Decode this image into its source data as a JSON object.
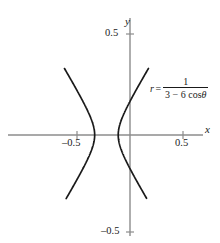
{
  "chart_data": {
    "type": "line",
    "title": "",
    "xlabel": "x",
    "ylabel": "y",
    "xlim": [
      -0.72,
      0.85
    ],
    "ylim": [
      -0.62,
      0.65
    ],
    "grid": false,
    "legend": null,
    "annotations": [
      {
        "name": "polar-equation",
        "text": "r = 1 / (3 - 6 cos θ)",
        "lhs": "r",
        "equals": "=",
        "numerator": "1",
        "denominator_prefix": "3 − 6 cos",
        "denominator_symbol": "θ",
        "x_px": 152,
        "y_px": 82
      }
    ],
    "x_ticks": [
      {
        "value": -0.5,
        "label": "–0.5"
      },
      {
        "value": 0.5,
        "label": "0.5"
      }
    ],
    "y_ticks": [
      {
        "value": 0.5,
        "label": "0.5"
      },
      {
        "value": -0.5,
        "label": "–0.5"
      }
    ],
    "curve_description": "Hyperbola r = 1/(3 - 6 cos(theta)), two branches opening left and right",
    "series": [
      {
        "name": "left-branch",
        "points_px": "M68,30 L74,45 L80,62 L85,80 L88,98 L90,116 L90.5,135 L90,154 L88,172 L85,190 L80,208 L74,225 L68,240"
      },
      {
        "name": "right-branch",
        "points_px": "M150,30 L140,48 L130,68 L121,88 L114,108 L110,122 L108.5,135 L110,150 L114,167 L121,186 L130,206 L140,224 L148,239"
      }
    ]
  },
  "axes": {
    "origin_px": {
      "x": 130,
      "y": 135
    },
    "scale_px_per_unit": {
      "x": 106,
      "y": 101
    },
    "axis_color": "#8c8c8c",
    "curve_color": "#1a1a1a",
    "x_axis_label": "x",
    "y_axis_label": "y"
  }
}
